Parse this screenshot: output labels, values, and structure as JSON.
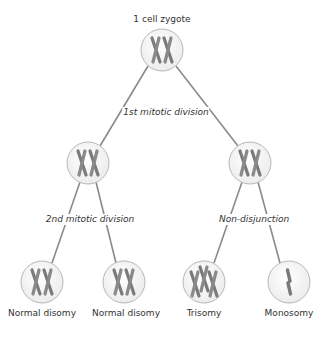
{
  "diagram": {
    "title_node": {
      "label": "1 cell zygote"
    },
    "edge_labels": {
      "first_division": "1st mitotic division",
      "second_division": "2nd mitotic division",
      "nondisjunction": "Non-disjunction"
    },
    "outcomes": [
      {
        "label": "Normal disomy",
        "chromosome_count": 2
      },
      {
        "label": "Normal disomy",
        "chromosome_count": 2
      },
      {
        "label": "Trisomy",
        "chromosome_count": 3
      },
      {
        "label": "Monosomy",
        "chromosome_count": 1
      }
    ],
    "colors": {
      "line": "#8a8a8a",
      "cell_fill": "#f2f2f2",
      "cell_stroke": "#b8b8b8",
      "chromosome": "#7a7a7a",
      "text": "#333333"
    }
  }
}
